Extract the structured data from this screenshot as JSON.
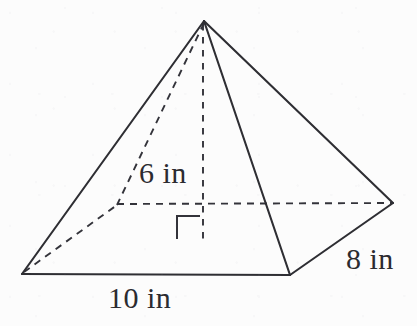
{
  "figure": {
    "kind": "rectangular-pyramid",
    "background_color": "#fcfcfc",
    "line_color": "#2e2e33",
    "hidden_line_color": "#33333a",
    "labels": {
      "height": "6 in",
      "depth": "8 in",
      "width": "10 in"
    },
    "vertices": {
      "apex": {
        "x": 204,
        "y": 21
      },
      "base_front_left": {
        "x": 22,
        "y": 274
      },
      "base_front_right": {
        "x": 290,
        "y": 275
      },
      "base_right": {
        "x": 393,
        "y": 203
      },
      "base_back_left": {
        "x": 117,
        "y": 205
      },
      "base_center": {
        "x": 203,
        "y": 244
      }
    },
    "edges": {
      "solid": [
        {
          "name": "apex-to-front-left",
          "from": "apex",
          "to": "base_front_left"
        },
        {
          "name": "apex-to-front-right",
          "from": "apex",
          "to": "base_front_right"
        },
        {
          "name": "apex-to-right",
          "from": "apex",
          "to": "base_right"
        },
        {
          "name": "base-front",
          "from": "base_front_left",
          "to": "base_front_right"
        },
        {
          "name": "base-right-front",
          "from": "base_front_right",
          "to": "base_right"
        }
      ],
      "hidden": [
        {
          "name": "apex-to-back-left",
          "from": "apex",
          "to": "base_back_left"
        },
        {
          "name": "base-back-left",
          "from": "base_front_left",
          "to": "base_back_left"
        },
        {
          "name": "base-back-diagonal",
          "from": "base_back_left",
          "to": "base_right"
        }
      ],
      "height": {
        "name": "apex-to-base-center",
        "from": "apex",
        "to": "base_center"
      }
    },
    "right_angle_marker": {
      "name": "right-angle-marker",
      "x": 177,
      "y": 216,
      "size": 23
    }
  }
}
